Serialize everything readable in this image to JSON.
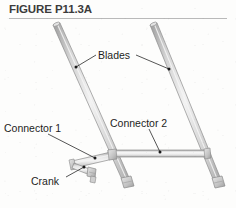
{
  "header": {
    "title": "FIGURE P11.3A",
    "rule_color": "#b9b9b9",
    "title_color": "#3b3b3b"
  },
  "figure": {
    "kind": "engineering-line-drawing",
    "background_color": "#fdfdfc",
    "bar_fill": "#c9c9c9",
    "bar_highlight": "#efefef",
    "bar_outline": "#8c8c8c",
    "leader_color": "#2a2a2a",
    "labels": [
      {
        "id": "blades",
        "text": "Blades",
        "x": 98,
        "y": 49,
        "leaders": [
          {
            "from": [
              96,
              56
            ],
            "to": [
              75,
              67
            ],
            "dot": [
              75,
              67
            ]
          },
          {
            "from": [
              135,
              55
            ],
            "to": [
              169,
              68
            ],
            "dot": [
              169,
              68
            ]
          }
        ]
      },
      {
        "id": "connector-1",
        "text": "Connector 1",
        "x": 4,
        "y": 122,
        "leaders": [
          {
            "from": [
              56,
              134
            ],
            "to": [
              95,
              158
            ],
            "dot": [
              95,
              158
            ]
          }
        ]
      },
      {
        "id": "connector-2",
        "text": "Connector 2",
        "x": 110,
        "y": 117,
        "leaders": [
          {
            "from": [
              150,
              130
            ],
            "to": [
              160,
              153
            ],
            "dot": [
              160,
              153
            ]
          }
        ]
      },
      {
        "id": "crank",
        "text": "Crank",
        "x": 31,
        "y": 175,
        "leaders": [
          {
            "from": [
              69,
              177
            ],
            "to": [
              84,
              168
            ],
            "dot": [
              84,
              168
            ]
          }
        ]
      }
    ],
    "members": [
      {
        "id": "blade-left",
        "name": "Blades",
        "from": [
          56,
          24
        ],
        "to": [
          124,
          183
        ]
      },
      {
        "id": "blade-right",
        "name": "Blades",
        "from": [
          153,
          24
        ],
        "to": [
          215,
          183
        ]
      },
      {
        "id": "connector-2-bar",
        "name": "Connector 2",
        "from": [
          110,
          155
        ],
        "to": [
          207,
          155
        ]
      },
      {
        "id": "connector-1-link",
        "name": "Connector 1",
        "from": [
          74,
          164
        ],
        "to": [
          112,
          156
        ]
      },
      {
        "id": "crank-link",
        "name": "Crank",
        "from": [
          74,
          164
        ],
        "to": [
          92,
          172
        ]
      }
    ],
    "joints": [
      {
        "id": "pivot-blade-left-base",
        "x": 124,
        "y": 183
      },
      {
        "id": "pivot-blade-right-base",
        "x": 215,
        "y": 183
      },
      {
        "id": "pivot-connector1-blade-left",
        "x": 112,
        "y": 156
      },
      {
        "id": "pivot-crank-ground",
        "x": 92,
        "y": 172
      }
    ]
  }
}
